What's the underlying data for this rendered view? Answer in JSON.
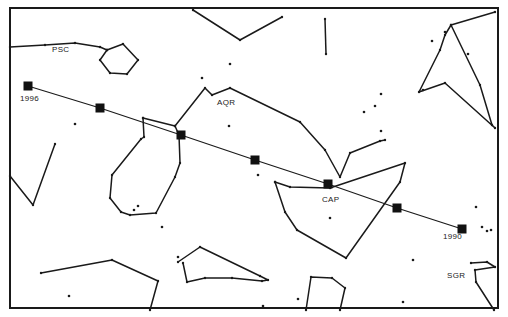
{
  "chart": {
    "title": "",
    "frame": {
      "x1": 10,
      "y1": 8,
      "x2": 498,
      "y2": 308
    }
  },
  "constellation_labels": [
    {
      "id": "psc",
      "text": "PSC",
      "x": 52,
      "y": 53
    },
    {
      "id": "aqr",
      "text": "AQR",
      "x": 217,
      "y": 106
    },
    {
      "id": "cap",
      "text": "CAP",
      "x": 322,
      "y": 203
    },
    {
      "id": "sgr",
      "text": "SGR",
      "x": 447,
      "y": 279
    }
  ],
  "year_labels": [
    {
      "id": "start",
      "text": "1996",
      "x": 20,
      "y": 102
    },
    {
      "id": "end",
      "text": "1990",
      "x": 443,
      "y": 240
    }
  ],
  "track": {
    "points": [
      [
        28,
        86
      ],
      [
        100,
        108
      ],
      [
        181,
        135
      ],
      [
        255,
        160
      ],
      [
        328,
        184
      ],
      [
        397,
        208
      ],
      [
        462,
        229
      ]
    ],
    "start_year": "1996",
    "end_year": "1990"
  },
  "constellation_lines": [
    [
      [
        10,
        47
      ],
      [
        45,
        45
      ],
      [
        75,
        43
      ],
      [
        100,
        47
      ],
      [
        107,
        50
      ]
    ],
    [
      [
        107,
        50
      ],
      [
        123,
        44
      ],
      [
        138,
        60
      ],
      [
        127,
        74
      ],
      [
        110,
        73
      ],
      [
        100,
        60
      ],
      [
        107,
        50
      ]
    ],
    [
      [
        193,
        10
      ],
      [
        240,
        40
      ],
      [
        282,
        17
      ]
    ],
    [
      [
        325,
        19
      ],
      [
        326,
        54
      ]
    ],
    [
      [
        10,
        176
      ],
      [
        33,
        205
      ],
      [
        55,
        144
      ]
    ],
    [
      [
        143,
        118
      ],
      [
        144,
        137
      ],
      [
        141,
        139
      ],
      [
        112,
        175
      ],
      [
        110,
        198
      ],
      [
        121,
        212
      ],
      [
        130,
        215
      ],
      [
        156,
        213
      ],
      [
        175,
        177
      ],
      [
        180,
        163
      ],
      [
        179,
        135
      ],
      [
        175,
        126
      ],
      [
        143,
        118
      ]
    ],
    [
      [
        175,
        126
      ],
      [
        205,
        88
      ],
      [
        212,
        95
      ],
      [
        230,
        88
      ],
      [
        300,
        122
      ],
      [
        325,
        150
      ],
      [
        340,
        177
      ],
      [
        350,
        153
      ],
      [
        380,
        141
      ],
      [
        385,
        140
      ]
    ],
    [
      [
        275,
        182
      ],
      [
        290,
        187
      ],
      [
        330,
        188
      ],
      [
        405,
        163
      ],
      [
        400,
        182
      ],
      [
        346,
        258
      ],
      [
        297,
        230
      ],
      [
        285,
        212
      ],
      [
        275,
        182
      ]
    ],
    [
      [
        495,
        12
      ],
      [
        451,
        25
      ],
      [
        445,
        35
      ],
      [
        440,
        50
      ],
      [
        419,
        92
      ],
      [
        445,
        83
      ],
      [
        495,
        128
      ],
      [
        492,
        125
      ],
      [
        480,
        85
      ],
      [
        451,
        25
      ]
    ],
    [
      [
        41,
        273
      ],
      [
        112,
        260
      ],
      [
        158,
        281
      ],
      [
        150,
        310
      ]
    ],
    [
      [
        178,
        262
      ],
      [
        200,
        247
      ],
      [
        260,
        276
      ],
      [
        268,
        280
      ],
      [
        262,
        281
      ],
      [
        232,
        278
      ],
      [
        205,
        278
      ],
      [
        187,
        282
      ],
      [
        183,
        263
      ]
    ],
    [
      [
        306,
        310
      ],
      [
        311,
        277
      ],
      [
        332,
        278
      ],
      [
        345,
        288
      ],
      [
        340,
        310
      ]
    ],
    [
      [
        471,
        263
      ],
      [
        487,
        262
      ],
      [
        495,
        267
      ],
      [
        475,
        270
      ],
      [
        476,
        282
      ],
      [
        494,
        310
      ]
    ]
  ],
  "stars": [
    [
      75,
      124
    ],
    [
      229,
      126
    ],
    [
      258,
      175
    ],
    [
      202,
      78
    ],
    [
      230,
      64
    ],
    [
      364,
      112
    ],
    [
      375,
      106
    ],
    [
      381,
      94
    ],
    [
      423,
      90
    ],
    [
      468,
      54
    ],
    [
      381,
      131
    ],
    [
      445,
      32
    ],
    [
      432,
      41
    ],
    [
      476,
      207
    ],
    [
      482,
      227
    ],
    [
      487,
      231
    ],
    [
      491,
      230
    ],
    [
      138,
      206
    ],
    [
      134,
      210
    ],
    [
      69,
      296
    ],
    [
      162,
      227
    ],
    [
      330,
      218
    ],
    [
      413,
      260
    ],
    [
      403,
      302
    ],
    [
      263,
      306
    ],
    [
      178,
      257
    ],
    [
      298,
      299
    ]
  ],
  "colors": {
    "line": "#1a1a1a",
    "marker": "#111111",
    "background": "#ffffff",
    "label": "#222222"
  }
}
